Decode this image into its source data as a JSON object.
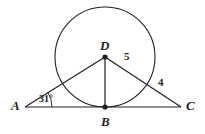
{
  "figure": {
    "background_color": "#ffffff",
    "stroke_color": "#231f20",
    "text_color": "#231f20"
  },
  "points": [
    {
      "id": "A",
      "label": "A",
      "x": 25,
      "y": 107,
      "label_x": 11,
      "label_y": 99
    },
    {
      "id": "B",
      "label": "B",
      "x": 105,
      "y": 107,
      "label_x": 101,
      "label_y": 115
    },
    {
      "id": "C",
      "label": "C",
      "x": 181,
      "y": 107,
      "label_x": 186,
      "label_y": 99
    },
    {
      "id": "D",
      "label": "D",
      "x": 105,
      "y": 57,
      "label_x": 100,
      "label_y": 39
    }
  ],
  "circle": {
    "center_x": 105,
    "center_y": 57,
    "radius": 50
  },
  "segments": [
    {
      "id": "AC",
      "from": "A",
      "to": "C"
    },
    {
      "id": "AD",
      "from": "A",
      "to": "D"
    },
    {
      "id": "DC",
      "from": "D",
      "to": "C"
    },
    {
      "id": "DB",
      "from": "D",
      "to": "B"
    }
  ],
  "measures": [
    {
      "id": "segment-5",
      "value": "5",
      "x": 124,
      "y": 51
    },
    {
      "id": "segment-4",
      "value": "4",
      "x": 158,
      "y": 77
    }
  ],
  "angles": [
    {
      "id": "angle-A",
      "value": "31°",
      "x": 39,
      "y": 94,
      "vertex": "A"
    }
  ]
}
